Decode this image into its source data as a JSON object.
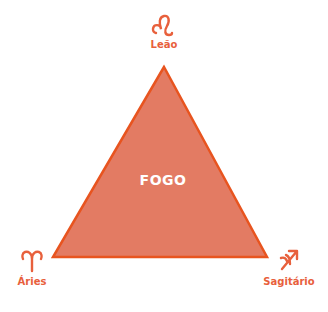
{
  "diagram": {
    "element": "FOGO",
    "colors": {
      "fill": "#e37b63",
      "stroke": "#e8541f",
      "text": "#e8603c",
      "center_text": "#ffffff"
    },
    "vertices": [
      {
        "sign": "Leão",
        "icon": "leo-icon",
        "position": "top"
      },
      {
        "sign": "Áries",
        "icon": "aries-icon",
        "position": "bottom-left"
      },
      {
        "sign": "Sagitário",
        "icon": "sagittarius-icon",
        "position": "bottom-right"
      }
    ]
  }
}
